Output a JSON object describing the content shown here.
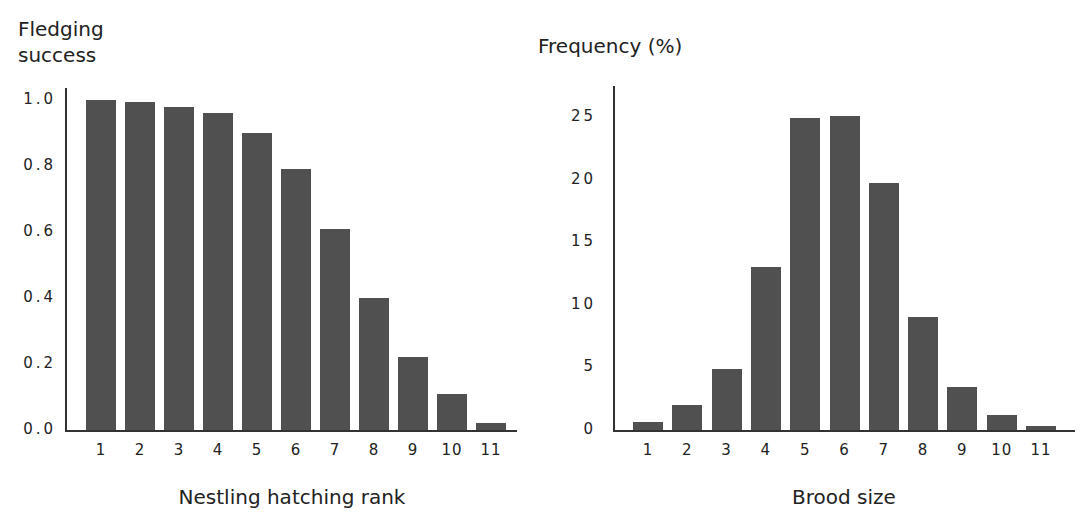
{
  "chart_data": [
    {
      "type": "bar",
      "title": "",
      "xlabel": "Nestling hatching rank",
      "ylabel": "Fledging\nsuccess",
      "categories": [
        "1",
        "2",
        "3",
        "4",
        "5",
        "6",
        "7",
        "8",
        "9",
        "10",
        "11"
      ],
      "values": [
        1.0,
        0.995,
        0.98,
        0.96,
        0.9,
        0.79,
        0.61,
        0.4,
        0.22,
        0.11,
        0.02
      ],
      "yticks": [
        "1.0",
        "0.8",
        "0.6",
        "0.4",
        "0.2",
        "0.0"
      ],
      "ytick_values": [
        1.0,
        0.8,
        0.6,
        0.4,
        0.2,
        0.0
      ],
      "ylim": [
        0,
        1.0
      ],
      "grid": false,
      "legend": null,
      "bar_color": "#505050"
    },
    {
      "type": "bar",
      "title": "",
      "xlabel": "Brood size",
      "ylabel": "Frequency (%)",
      "categories": [
        "1",
        "2",
        "3",
        "4",
        "5",
        "6",
        "7",
        "8",
        "9",
        "10",
        "11"
      ],
      "values": [
        0.6,
        2.0,
        4.9,
        13.0,
        24.9,
        25.1,
        19.7,
        9.0,
        3.4,
        1.2,
        0.3
      ],
      "yticks": [
        "25",
        "20",
        "15",
        "10",
        "5",
        "0"
      ],
      "ytick_values": [
        25,
        20,
        15,
        10,
        5,
        0
      ],
      "ylim": [
        0,
        25
      ],
      "grid": false,
      "legend": null,
      "bar_color": "#505050"
    }
  ]
}
